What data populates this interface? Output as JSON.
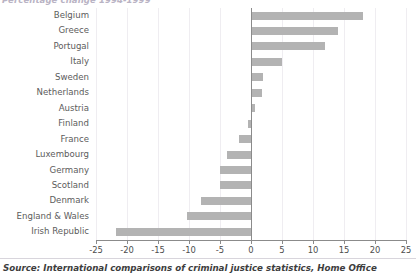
{
  "chart_data": {
    "type": "bar",
    "orientation": "horizontal",
    "title": "Percentage change 1994-1999",
    "xlabel": "",
    "ylabel": "",
    "xlim": [
      -25,
      25
    ],
    "xticks": [
      "-25",
      "-20",
      "-15",
      "-10",
      "-5",
      "0",
      "5",
      "10",
      "15",
      "20",
      "25"
    ],
    "xtick_values": [
      -25,
      -20,
      -15,
      -10,
      -5,
      0,
      5,
      10,
      15,
      20,
      25
    ],
    "grid": true,
    "legend": "none",
    "bar_color": "#b3b3b3",
    "categories": [
      "Belgium",
      "Greece",
      "Portugal",
      "Italy",
      "Sweden",
      "Netherlands",
      "Austria",
      "Finland",
      "France",
      "Luxembourg",
      "Germany",
      "Scotland",
      "Denmark",
      "England & Wales",
      "Irish Republic"
    ],
    "values": [
      18,
      14,
      12,
      5,
      2,
      1.8,
      0.6,
      -0.5,
      -2,
      -3.8,
      -5,
      -5,
      -8,
      -10.3,
      -21.8
    ]
  },
  "footer": {
    "source": "Source: International comparisons of criminal justice statistics, Home Office"
  }
}
